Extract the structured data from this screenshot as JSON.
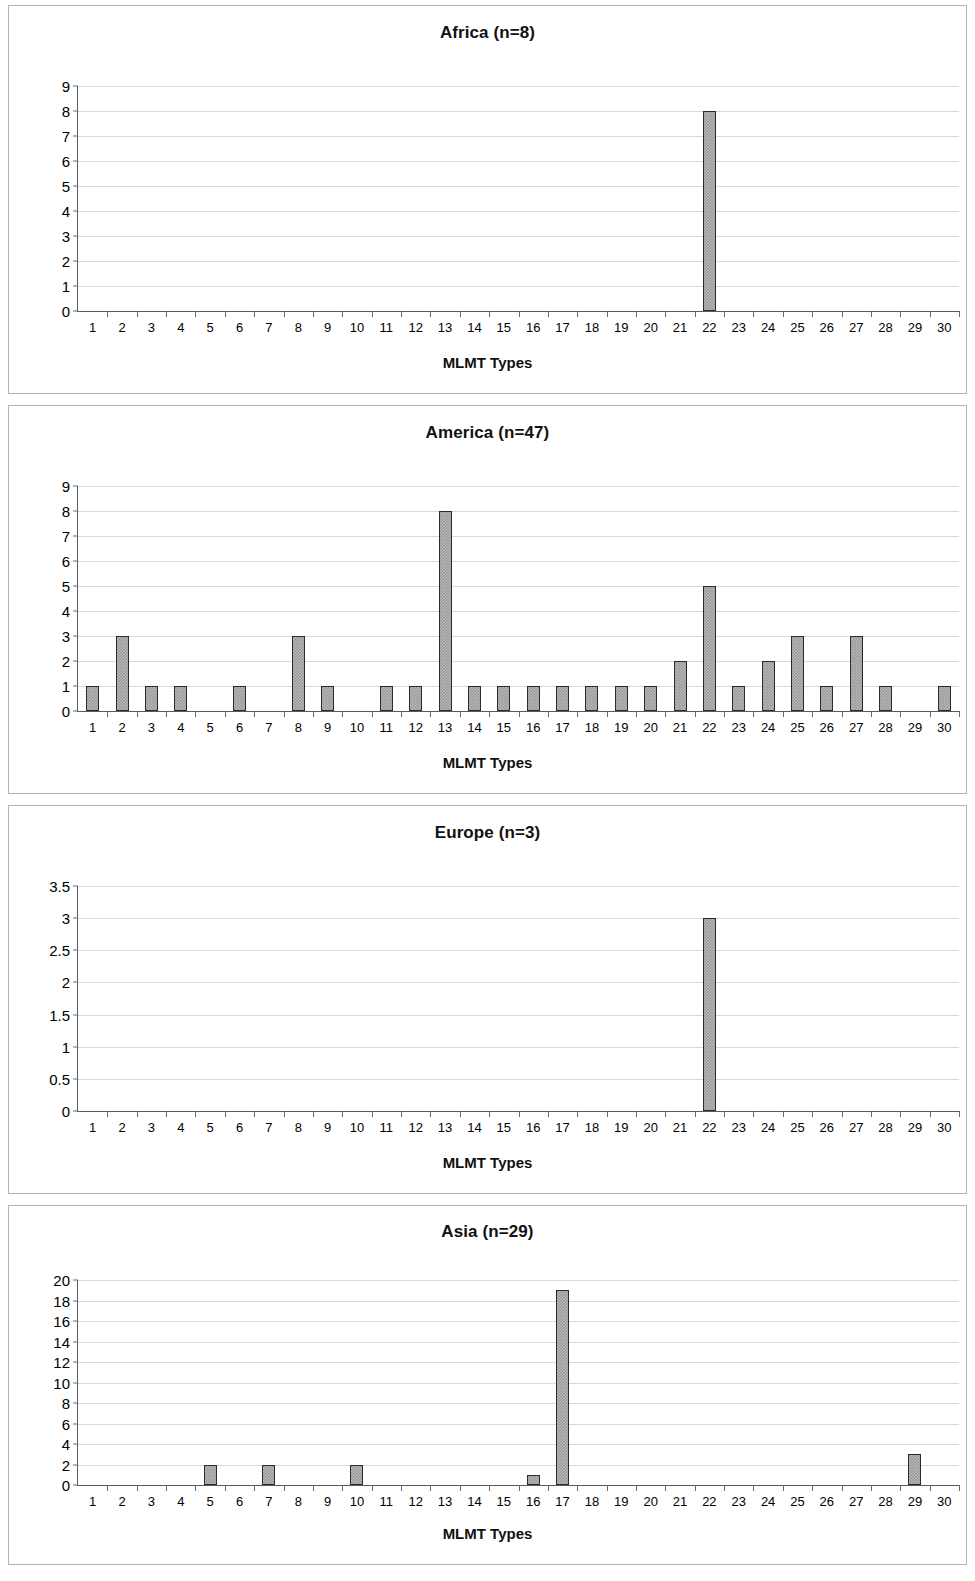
{
  "page": {
    "shared_xlabel": "MLMT Types",
    "categories": [
      1,
      2,
      3,
      4,
      5,
      6,
      7,
      8,
      9,
      10,
      11,
      12,
      13,
      14,
      15,
      16,
      17,
      18,
      19,
      20,
      21,
      22,
      23,
      24,
      25,
      26,
      27,
      28,
      29,
      30
    ],
    "bar_color": "#9a9a9a",
    "bar_border_color": "#2b2b2b",
    "gridline_color": "#d9d9d9",
    "axis_color": "#5a5a5a",
    "panel_border_color": "#b4b4b4"
  },
  "chart_data": [
    {
      "id": "africa",
      "type": "bar",
      "title": "Africa (n=8)",
      "region": "Africa",
      "n": 8,
      "xlabel": "MLMT Types",
      "ylabel": "",
      "ylim": [
        0,
        9
      ],
      "ytick_step": 1,
      "yticks": [
        0,
        1,
        2,
        3,
        4,
        5,
        6,
        7,
        8,
        9
      ],
      "ytick_labels": [
        "0",
        "1",
        "2",
        "3",
        "4",
        "5",
        "6",
        "7",
        "8",
        "9"
      ],
      "grid": true,
      "legend": "none",
      "categories": [
        1,
        2,
        3,
        4,
        5,
        6,
        7,
        8,
        9,
        10,
        11,
        12,
        13,
        14,
        15,
        16,
        17,
        18,
        19,
        20,
        21,
        22,
        23,
        24,
        25,
        26,
        27,
        28,
        29,
        30
      ],
      "values": [
        0,
        0,
        0,
        0,
        0,
        0,
        0,
        0,
        0,
        0,
        0,
        0,
        0,
        0,
        0,
        0,
        0,
        0,
        0,
        0,
        0,
        8,
        0,
        0,
        0,
        0,
        0,
        0,
        0,
        0
      ]
    },
    {
      "id": "america",
      "type": "bar",
      "title": "America (n=47)",
      "region": "America",
      "n": 47,
      "xlabel": "MLMT Types",
      "ylabel": "",
      "ylim": [
        0,
        9
      ],
      "ytick_step": 1,
      "yticks": [
        0,
        1,
        2,
        3,
        4,
        5,
        6,
        7,
        8,
        9
      ],
      "ytick_labels": [
        "0",
        "1",
        "2",
        "3",
        "4",
        "5",
        "6",
        "7",
        "8",
        "9"
      ],
      "grid": true,
      "legend": "none",
      "categories": [
        1,
        2,
        3,
        4,
        5,
        6,
        7,
        8,
        9,
        10,
        11,
        12,
        13,
        14,
        15,
        16,
        17,
        18,
        19,
        20,
        21,
        22,
        23,
        24,
        25,
        26,
        27,
        28,
        29,
        30
      ],
      "values": [
        1,
        3,
        1,
        1,
        0,
        1,
        0,
        3,
        1,
        0,
        1,
        1,
        8,
        1,
        1,
        1,
        1,
        1,
        1,
        1,
        2,
        5,
        1,
        2,
        3,
        1,
        3,
        1,
        0,
        1
      ]
    },
    {
      "id": "europe",
      "type": "bar",
      "title": "Europe (n=3)",
      "region": "Europe",
      "n": 3,
      "xlabel": "MLMT Types",
      "ylabel": "",
      "ylim": [
        0,
        3.5
      ],
      "ytick_step": 0.5,
      "yticks": [
        0,
        0.5,
        1,
        1.5,
        2,
        2.5,
        3,
        3.5
      ],
      "ytick_labels": [
        "0",
        "0.5",
        "1",
        "1.5",
        "2",
        "2.5",
        "3",
        "3.5"
      ],
      "grid": true,
      "legend": "none",
      "categories": [
        1,
        2,
        3,
        4,
        5,
        6,
        7,
        8,
        9,
        10,
        11,
        12,
        13,
        14,
        15,
        16,
        17,
        18,
        19,
        20,
        21,
        22,
        23,
        24,
        25,
        26,
        27,
        28,
        29,
        30
      ],
      "values": [
        0,
        0,
        0,
        0,
        0,
        0,
        0,
        0,
        0,
        0,
        0,
        0,
        0,
        0,
        0,
        0,
        0,
        0,
        0,
        0,
        0,
        3,
        0,
        0,
        0,
        0,
        0,
        0,
        0,
        0
      ]
    },
    {
      "id": "asia",
      "type": "bar",
      "title": "Asia (n=29)",
      "region": "Asia",
      "n": 29,
      "xlabel": "MLMT Types",
      "ylabel": "",
      "ylim": [
        0,
        20
      ],
      "ytick_step": 2,
      "yticks": [
        0,
        2,
        4,
        6,
        8,
        10,
        12,
        14,
        16,
        18,
        20
      ],
      "ytick_labels": [
        "0",
        "2",
        "4",
        "6",
        "8",
        "10",
        "12",
        "14",
        "16",
        "18",
        "20"
      ],
      "grid": true,
      "legend": "none",
      "categories": [
        1,
        2,
        3,
        4,
        5,
        6,
        7,
        8,
        9,
        10,
        11,
        12,
        13,
        14,
        15,
        16,
        17,
        18,
        19,
        20,
        21,
        22,
        23,
        24,
        25,
        26,
        27,
        28,
        29,
        30
      ],
      "values": [
        0,
        0,
        0,
        0,
        2,
        0,
        2,
        0,
        0,
        2,
        0,
        0,
        0,
        0,
        0,
        1,
        19,
        0,
        0,
        0,
        0,
        0,
        0,
        0,
        0,
        0,
        0,
        0,
        3,
        0
      ]
    }
  ]
}
